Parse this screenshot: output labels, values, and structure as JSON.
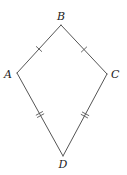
{
  "diagram": {
    "type": "kite",
    "vertices": [
      {
        "id": "B",
        "label": "B",
        "x": 61,
        "y": 25,
        "label_x": 61,
        "label_y": 20,
        "anchor": "middle"
      },
      {
        "id": "A",
        "label": "A",
        "x": 17,
        "y": 73,
        "label_x": 12,
        "label_y": 78,
        "anchor": "end"
      },
      {
        "id": "C",
        "label": "C",
        "x": 107,
        "y": 74,
        "label_x": 111,
        "label_y": 78,
        "anchor": "start"
      },
      {
        "id": "D",
        "label": "D",
        "x": 63,
        "y": 156,
        "label_x": 63,
        "label_y": 168,
        "anchor": "middle"
      }
    ],
    "edges": [
      {
        "from": "A",
        "to": "B",
        "ticks": 1
      },
      {
        "from": "B",
        "to": "C",
        "ticks": 1
      },
      {
        "from": "C",
        "to": "D",
        "ticks": 2
      },
      {
        "from": "D",
        "to": "A",
        "ticks": 2
      }
    ],
    "colors": {
      "line": "#555555",
      "text": "#222222",
      "background": "#ffffff"
    }
  }
}
